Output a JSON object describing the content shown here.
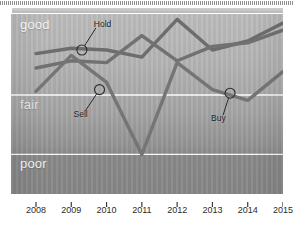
{
  "chart_data": {
    "type": "line",
    "title": "",
    "xlabel": "",
    "ylabel": "",
    "categories": [
      "2008",
      "2009",
      "2010",
      "2011",
      "2012",
      "2013",
      "2014",
      "2015"
    ],
    "x": [
      2008,
      2009,
      2010,
      2011,
      2012,
      2013,
      2014,
      2015
    ],
    "ylim": [
      0,
      100
    ],
    "grid": false,
    "legend_position": "none",
    "y_band_labels": [
      "good",
      "fair",
      "poor"
    ],
    "y_band_values": {
      "good": 100,
      "fair": 55,
      "poor": 22
    },
    "series": [
      {
        "name": "series-a",
        "color": "#6d6d6d",
        "values": [
          78,
          81,
          80,
          76,
          97,
          80,
          85,
          95
        ]
      },
      {
        "name": "series-b",
        "color": "#717171",
        "values": [
          70,
          74,
          73,
          88,
          74,
          82,
          84,
          91
        ]
      },
      {
        "name": "series-c",
        "color": "#757575",
        "values": [
          57,
          77,
          62,
          22,
          73,
          58,
          52,
          68
        ]
      }
    ],
    "annotations": [
      {
        "label": "Hold",
        "x": 2009.3,
        "y": 80,
        "series": "series-a"
      },
      {
        "label": "Sell",
        "x": 2009.8,
        "y": 58,
        "series": "series-c"
      },
      {
        "label": "Buy",
        "x": 2013.5,
        "y": 56,
        "series": "series-c"
      }
    ]
  },
  "axis": {
    "ticks": [
      "2008",
      "2009",
      "2010",
      "2011",
      "2012",
      "2013",
      "2014",
      "2015"
    ]
  },
  "bands": {
    "good": "good",
    "fair": "fair",
    "poor": "poor"
  },
  "callouts": {
    "hold": "Hold",
    "sell": "Sell",
    "buy": "Buy"
  },
  "colors": {
    "band_line": "#ffffff",
    "line_a": "#6d6d6d",
    "line_b": "#717171",
    "line_c": "#757575",
    "label_light": "#f2f2f2",
    "label_dark": "#1d1d1d"
  }
}
